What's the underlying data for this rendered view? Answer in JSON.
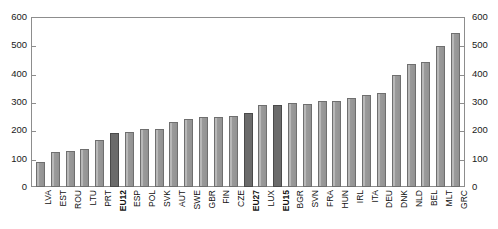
{
  "chart_data": {
    "type": "bar",
    "title": "",
    "subtitle": "",
    "xlabel": "",
    "ylabel": "",
    "ylim": [
      0,
      600
    ],
    "yticks": [
      0,
      100,
      200,
      300,
      400,
      500,
      600
    ],
    "ytick_labels": [
      "0",
      "100",
      "200",
      "300",
      "400",
      "500",
      "600"
    ],
    "right_axis": {
      "visible": true,
      "ylim": [
        0,
        600
      ],
      "yticks": [
        0,
        100,
        200,
        300,
        400,
        500,
        600
      ],
      "ytick_labels": [
        "0",
        "100",
        "200",
        "300",
        "400",
        "500",
        "600"
      ]
    },
    "grid": false,
    "legend": null,
    "categories": [
      "LVA",
      "EST",
      "ROU",
      "LTU",
      "PRT",
      "EU12",
      "ESP",
      "POL",
      "SVK",
      "AUT",
      "SWE",
      "GBR",
      "FIN",
      "CZE",
      "EU27",
      "LUX",
      "EU15",
      "BGR",
      "SVN",
      "FRA",
      "HUN",
      "IRL",
      "ITA",
      "DEU",
      "DNK",
      "NLD",
      "BEL",
      "MLT",
      "GRC"
    ],
    "values": [
      87,
      122,
      128,
      135,
      165,
      192,
      195,
      205,
      205,
      228,
      240,
      248,
      248,
      252,
      260,
      288,
      288,
      295,
      293,
      305,
      305,
      315,
      325,
      333,
      397,
      435,
      440,
      498,
      545
    ],
    "highlighted": [
      "EU12",
      "EU27",
      "EU15"
    ],
    "bar_colors": {
      "normal": "#9a9a9a",
      "highlight": "#6b6b6b",
      "border": "#6f6f6f"
    },
    "axis_color": "#8d8d8d",
    "background": "#ffffff"
  }
}
